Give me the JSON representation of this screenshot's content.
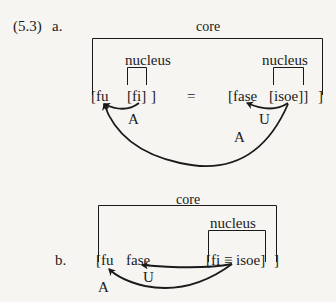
{
  "example_number": "(5.3)",
  "a": {
    "label": "a.",
    "core_label": "core",
    "nucleus_labels": [
      "nucleus",
      "nucleus"
    ],
    "tokens": {
      "fu": "[fu",
      "fi": "[fi]",
      "close1": "]",
      "equals": "=",
      "fase": "[fase",
      "isoe": "[isoe]]",
      "close2": "]"
    },
    "arrow_labels": {
      "fi_to_fu": "A",
      "isoe_to_fase": "U",
      "isoe_to_fu": "A"
    }
  },
  "b": {
    "label": "b.",
    "core_label": "core",
    "nucleus_label": "nucleus",
    "tokens": {
      "fu": "[fu",
      "fase": "fase",
      "fi_isoe": "[fi ≡ isoe]",
      "close": "]"
    },
    "arrow_labels": {
      "to_fase": "U",
      "to_fu": "A"
    }
  }
}
